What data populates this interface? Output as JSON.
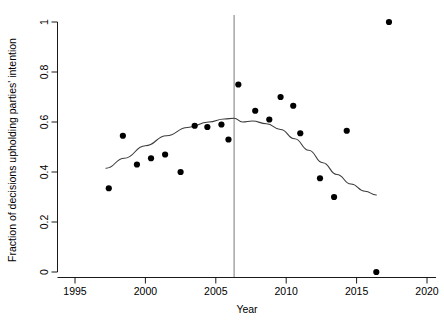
{
  "chart_data": {
    "type": "scatter",
    "title": "",
    "xlabel": "Year",
    "ylabel": "Fraction of decisions upholding parties' intention",
    "xlim": [
      1995,
      2020.6
    ],
    "ylim": [
      0,
      1.03
    ],
    "xticks": [
      1995,
      2000,
      2005,
      2010,
      2015,
      2020
    ],
    "xticklabels": [
      "1995",
      "2000",
      "2005",
      "2010",
      "2015",
      "2020"
    ],
    "yticks": [
      0,
      0.2,
      0.4,
      0.6,
      0.8,
      1
    ],
    "yticklabels": [
      "0",
      "0.2",
      "0.4",
      "0.6",
      "0.8",
      "1"
    ],
    "grid": false,
    "legend": null,
    "points": [
      {
        "x": 1997.4,
        "y": 0.335
      },
      {
        "x": 1998.4,
        "y": 0.545
      },
      {
        "x": 1999.4,
        "y": 0.43
      },
      {
        "x": 2000.4,
        "y": 0.455
      },
      {
        "x": 2001.4,
        "y": 0.47
      },
      {
        "x": 2002.5,
        "y": 0.4
      },
      {
        "x": 2003.5,
        "y": 0.585
      },
      {
        "x": 2004.4,
        "y": 0.58
      },
      {
        "x": 2005.4,
        "y": 0.59
      },
      {
        "x": 2005.9,
        "y": 0.53
      },
      {
        "x": 2006.6,
        "y": 0.75
      },
      {
        "x": 2007.8,
        "y": 0.645
      },
      {
        "x": 2008.8,
        "y": 0.61
      },
      {
        "x": 2009.6,
        "y": 0.7
      },
      {
        "x": 2010.5,
        "y": 0.665
      },
      {
        "x": 2011.0,
        "y": 0.555
      },
      {
        "x": 2012.4,
        "y": 0.375
      },
      {
        "x": 2013.4,
        "y": 0.3
      },
      {
        "x": 2014.3,
        "y": 0.565
      },
      {
        "x": 2016.4,
        "y": 0.0
      },
      {
        "x": 2017.3,
        "y": 1.0
      }
    ],
    "fit_curve": {
      "name": "smoothed trend",
      "x": [
        1997.2,
        1998.5,
        2000.0,
        2001.5,
        2003.0,
        2004.5,
        2005.6,
        2006.3,
        2006.9,
        2007.6,
        2008.6,
        2009.6,
        2010.6,
        2011.6,
        2012.6,
        2013.6,
        2014.6,
        2015.6,
        2016.4
      ],
      "y": [
        0.415,
        0.455,
        0.505,
        0.545,
        0.578,
        0.6,
        0.612,
        0.615,
        0.6,
        0.604,
        0.593,
        0.57,
        0.533,
        0.487,
        0.437,
        0.39,
        0.352,
        0.323,
        0.308
      ]
    },
    "vline": {
      "x": 2006.3,
      "color": "#6b6b6b"
    },
    "colors": {
      "point": "#000000",
      "line": "#3c3c3c",
      "axis": "#000000",
      "background": "#ffffff"
    }
  },
  "axes": {
    "xlabel": "Year",
    "ylabel": "Fraction of decisions upholding parties' intention"
  }
}
